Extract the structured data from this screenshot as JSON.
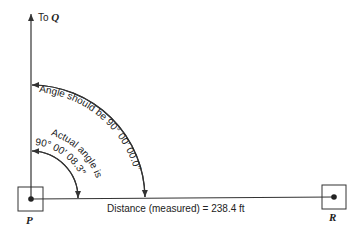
{
  "diagram": {
    "direction_label": "To",
    "direction_target": "Q",
    "outer_arc_label": "Angle should be 90° 00′ 00.0″",
    "inner_arc_label_line1": "Actual angle is",
    "inner_arc_label_line2": "90° 00′ 08.3″",
    "distance_label": "Distance (measured) = 238.4 ft",
    "point_p": "P",
    "point_r": "R",
    "colors": {
      "ink": "#333333",
      "background": "#ffffff"
    }
  }
}
